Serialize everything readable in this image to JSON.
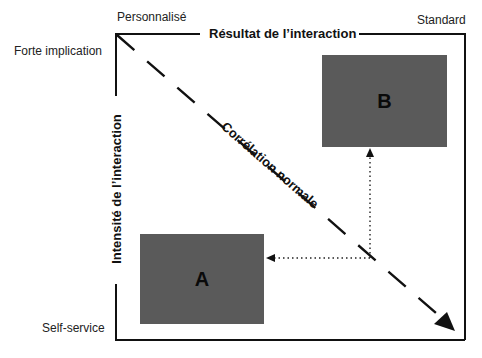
{
  "diagram": {
    "top_axis": {
      "title": "Résultat de l’interaction",
      "left_end_label": "Personnalisé",
      "right_end_label": "Standard"
    },
    "left_axis": {
      "title": "Intensité de l’interaction",
      "top_end_label": "Forte implication",
      "bottom_end_label": "Self-service"
    },
    "diagonal": {
      "label": "Corrélation normale",
      "style": "dashed-arrow"
    },
    "boxes": [
      {
        "id": "A",
        "label": "A",
        "color": "#5a5a5a"
      },
      {
        "id": "B",
        "label": "B",
        "color": "#5a5a5a"
      }
    ],
    "connector": {
      "style": "dotted-arrows",
      "from_point": "on diagonal",
      "to": [
        "A",
        "B"
      ]
    }
  }
}
